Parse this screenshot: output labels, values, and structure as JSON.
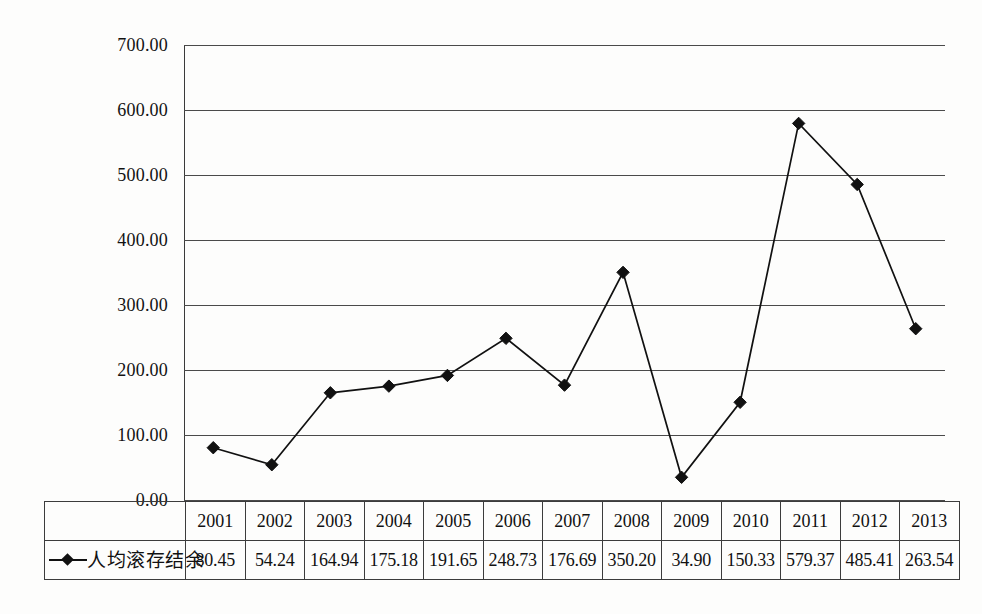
{
  "chart_data": {
    "type": "line",
    "title": "",
    "xlabel": "",
    "ylabel": "",
    "categories": [
      "2001",
      "2002",
      "2003",
      "2004",
      "2005",
      "2006",
      "2007",
      "2008",
      "2009",
      "2010",
      "2011",
      "2012",
      "2013"
    ],
    "series": [
      {
        "name": "人均滚存结余",
        "values": [
          80.45,
          54.24,
          164.94,
          175.18,
          191.65,
          248.73,
          176.69,
          350.2,
          34.9,
          150.33,
          579.37,
          485.41,
          263.54
        ],
        "marker": "diamond",
        "color": "#111111"
      }
    ],
    "ylim": [
      0,
      700
    ],
    "ytick_step": 100,
    "ytick_labels": [
      "0.00",
      "100.00",
      "200.00",
      "300.00",
      "400.00",
      "500.00",
      "600.00",
      "700.00"
    ],
    "grid": "horizontal",
    "legend_position": "table-left",
    "has_data_table": true
  },
  "axis": {
    "y_ticks": [
      {
        "value": 700,
        "label": "700.00"
      },
      {
        "value": 600,
        "label": "600.00"
      },
      {
        "value": 500,
        "label": "500.00"
      },
      {
        "value": 400,
        "label": "400.00"
      },
      {
        "value": 300,
        "label": "300.00"
      },
      {
        "value": 200,
        "label": "200.00"
      },
      {
        "value": 100,
        "label": "100.00"
      },
      {
        "value": 0,
        "label": "0.00"
      }
    ]
  },
  "table": {
    "legend_label": "人均滚存结余",
    "years": [
      "2001",
      "2002",
      "2003",
      "2004",
      "2005",
      "2006",
      "2007",
      "2008",
      "2009",
      "2010",
      "2011",
      "2012",
      "2013"
    ],
    "values": [
      "80.45",
      "54.24",
      "164.94",
      "175.18",
      "191.65",
      "248.73",
      "176.69",
      "350.20",
      "34.90",
      "150.33",
      "579.37",
      "485.41",
      "263.54"
    ]
  },
  "colors": {
    "line": "#111111",
    "marker": "#111111",
    "gridline": "#4a4a4a",
    "axis": "#3a3a3a",
    "table_border": "#3c3c3c",
    "background": "#fdfdfc",
    "text": "#111111"
  }
}
